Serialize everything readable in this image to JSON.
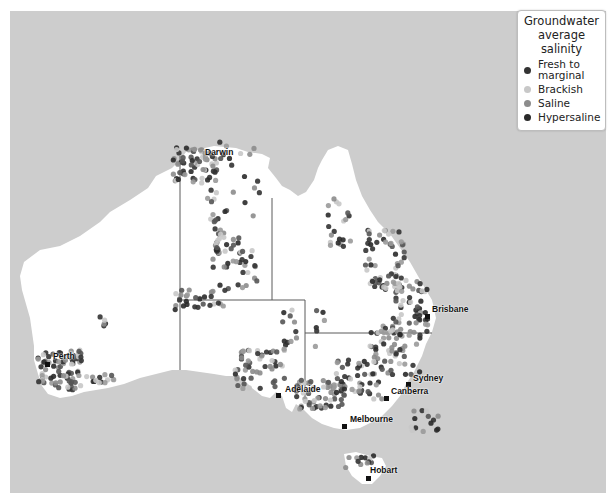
{
  "legend": {
    "title_line1": "Groundwater",
    "title_line2": "average salinity",
    "items": [
      {
        "label": "Fresh to marginal",
        "label_line1": "Fresh to",
        "label_line2": "marginal",
        "color": "#333333"
      },
      {
        "label": "Brackish",
        "color": "#c8c8c8"
      },
      {
        "label": "Saline",
        "color": "#8c8c8c"
      },
      {
        "label": "Hypersaline",
        "color": "#2a2a2a"
      }
    ]
  },
  "cities": [
    {
      "name": "Darwin",
      "x": 205,
      "y": 147,
      "marker_x": 0,
      "marker_y": 0,
      "show_marker": false
    },
    {
      "name": "Brisbane",
      "x": 432,
      "y": 304,
      "marker_x": 425,
      "marker_y": 314
    },
    {
      "name": "Perth",
      "x": 53,
      "y": 351,
      "marker_x": 45,
      "marker_y": 362
    },
    {
      "name": "Adelaide",
      "x": 285,
      "y": 384,
      "marker_x": 276,
      "marker_y": 393
    },
    {
      "name": "Sydney",
      "x": 413,
      "y": 373,
      "marker_x": 406,
      "marker_y": 382
    },
    {
      "name": "Canberra",
      "x": 391,
      "y": 386,
      "marker_x": 384,
      "marker_y": 396
    },
    {
      "name": "Melbourne",
      "x": 350,
      "y": 414,
      "marker_x": 342,
      "marker_y": 424
    },
    {
      "name": "Hobart",
      "x": 370,
      "y": 465,
      "marker_x": 366,
      "marker_y": 476
    }
  ],
  "colors": {
    "sea": "#cdcdcd",
    "land": "#ffffff",
    "border": "#5a5a5a"
  }
}
